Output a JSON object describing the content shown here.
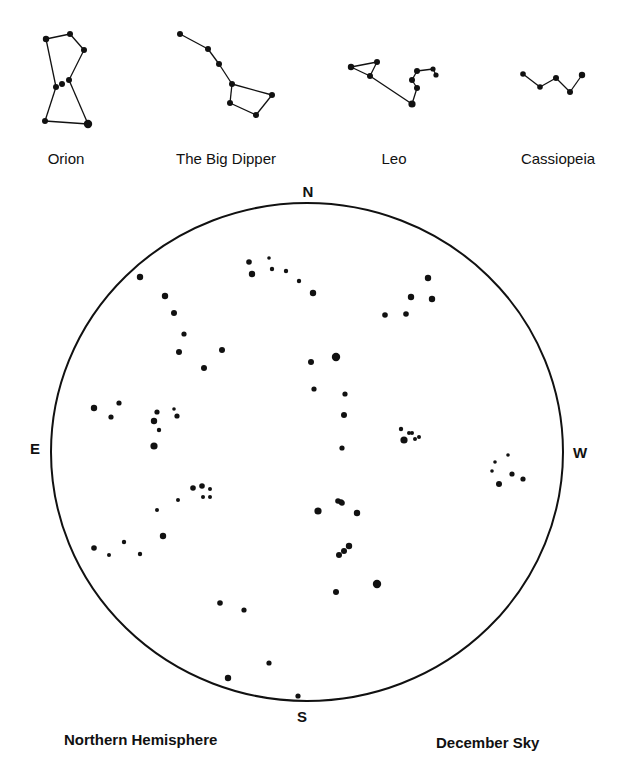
{
  "colors": {
    "ink": "#111111",
    "background": "#ffffff"
  },
  "constellation_key": [
    {
      "name": "Orion",
      "label_pos": [
        66,
        150
      ],
      "stars": [
        [
          46,
          39,
          3.2
        ],
        [
          70,
          34,
          3
        ],
        [
          84,
          50,
          3
        ],
        [
          69,
          80,
          3
        ],
        [
          56,
          87,
          3
        ],
        [
          62,
          84,
          3
        ],
        [
          45,
          121,
          3
        ],
        [
          88,
          124,
          4.2
        ]
      ],
      "lines": [
        [
          0,
          1
        ],
        [
          1,
          2
        ],
        [
          2,
          3
        ],
        [
          3,
          7
        ],
        [
          7,
          6
        ],
        [
          6,
          4
        ],
        [
          4,
          0
        ]
      ]
    },
    {
      "name": "The Big Dipper",
      "label_pos": [
        226,
        150
      ],
      "stars": [
        [
          180,
          34,
          3
        ],
        [
          208,
          49,
          3
        ],
        [
          219,
          64,
          3
        ],
        [
          232,
          84,
          3
        ],
        [
          272,
          95,
          3
        ],
        [
          256,
          115,
          3
        ],
        [
          230,
          103,
          3
        ]
      ],
      "lines": [
        [
          0,
          1
        ],
        [
          1,
          2
        ],
        [
          2,
          3
        ],
        [
          3,
          4
        ],
        [
          4,
          5
        ],
        [
          5,
          6
        ],
        [
          6,
          3
        ]
      ]
    },
    {
      "name": "Leo",
      "label_pos": [
        394,
        150
      ],
      "stars": [
        [
          351,
          67,
          3.2
        ],
        [
          377,
          62,
          3
        ],
        [
          370,
          76,
          3
        ],
        [
          412,
          104,
          3.6
        ],
        [
          417,
          88,
          3
        ],
        [
          412,
          80,
          3
        ],
        [
          417,
          71,
          3
        ],
        [
          433,
          69,
          2.6
        ],
        [
          436,
          75,
          2.6
        ]
      ],
      "lines": [
        [
          0,
          1
        ],
        [
          1,
          2
        ],
        [
          2,
          0
        ],
        [
          2,
          3
        ],
        [
          3,
          4
        ],
        [
          4,
          5
        ],
        [
          5,
          6
        ],
        [
          6,
          7
        ],
        [
          7,
          8
        ]
      ]
    },
    {
      "name": "Cassiopeia",
      "label_pos": [
        558,
        150
      ],
      "stars": [
        [
          523,
          74,
          2.8
        ],
        [
          540,
          87,
          2.8
        ],
        [
          556,
          78,
          3
        ],
        [
          570,
          92,
          3
        ],
        [
          582,
          75,
          3.2
        ]
      ],
      "lines": [
        [
          0,
          1
        ],
        [
          1,
          2
        ],
        [
          2,
          3
        ],
        [
          3,
          4
        ]
      ]
    }
  ],
  "sky_chart": {
    "ellipse": {
      "cx": 307,
      "cy": 452,
      "rx": 256,
      "ry": 249
    },
    "compass": {
      "north": {
        "label": "N",
        "pos": [
          308,
          191
        ]
      },
      "south": {
        "label": "S",
        "pos": [
          302,
          716
        ]
      },
      "east": {
        "label": "E",
        "pos": [
          35,
          448
        ]
      },
      "west": {
        "label": "W",
        "pos": [
          580,
          452
        ]
      }
    },
    "stars": [
      [
        140,
        277,
        3.2
      ],
      [
        165,
        296,
        3.2
      ],
      [
        174,
        313,
        3
      ],
      [
        184,
        334,
        2.6
      ],
      [
        179,
        352,
        3
      ],
      [
        222,
        350,
        3
      ],
      [
        204,
        368,
        3
      ],
      [
        249,
        262,
        2.8
      ],
      [
        269,
        258,
        1.8
      ],
      [
        272,
        269,
        2.2
      ],
      [
        286,
        271,
        2.2
      ],
      [
        299,
        281,
        2.2
      ],
      [
        252,
        274,
        3.2
      ],
      [
        313,
        293,
        3.2
      ],
      [
        428,
        278,
        3.2
      ],
      [
        411,
        297,
        3.2
      ],
      [
        432,
        299,
        3.2
      ],
      [
        406,
        314,
        2.8
      ],
      [
        385,
        315,
        2.8
      ],
      [
        311,
        362,
        3
      ],
      [
        336,
        357,
        4.2
      ],
      [
        314,
        389,
        2.6
      ],
      [
        345,
        394,
        2.6
      ],
      [
        344,
        415,
        3
      ],
      [
        342,
        448,
        2.6
      ],
      [
        401,
        429,
        2.2
      ],
      [
        409,
        433,
        2
      ],
      [
        412,
        433,
        2
      ],
      [
        404,
        440,
        3.6
      ],
      [
        415,
        439,
        2
      ],
      [
        419,
        437,
        2
      ],
      [
        508,
        455,
        1.8
      ],
      [
        495,
        462,
        1.8
      ],
      [
        492,
        471,
        1.8
      ],
      [
        512,
        474,
        2.6
      ],
      [
        523,
        479,
        2.6
      ],
      [
        499,
        484,
        3
      ],
      [
        94,
        408,
        3.2
      ],
      [
        119,
        403,
        2.6
      ],
      [
        111,
        417,
        2.6
      ],
      [
        157,
        412,
        2.6
      ],
      [
        174,
        409,
        1.8
      ],
      [
        177,
        416,
        2.6
      ],
      [
        154,
        421,
        3.2
      ],
      [
        159,
        430,
        2.2
      ],
      [
        154,
        446,
        3.6
      ],
      [
        193,
        488,
        2.8
      ],
      [
        202,
        486,
        2.8
      ],
      [
        210,
        489,
        2
      ],
      [
        203,
        497,
        2
      ],
      [
        210,
        497,
        2
      ],
      [
        178,
        500,
        2
      ],
      [
        157,
        510,
        2
      ],
      [
        163,
        536,
        3.2
      ],
      [
        94,
        548,
        2.8
      ],
      [
        124,
        542,
        2.2
      ],
      [
        109,
        555,
        2
      ],
      [
        140,
        554,
        2.2
      ],
      [
        338,
        501,
        2.8
      ],
      [
        341,
        502,
        2.8
      ],
      [
        342,
        503,
        2.8
      ],
      [
        318,
        511,
        3.6
      ],
      [
        357,
        513,
        3.2
      ],
      [
        349,
        546,
        3.2
      ],
      [
        344,
        551,
        3
      ],
      [
        339,
        555,
        3
      ],
      [
        377,
        584,
        4.2
      ],
      [
        336,
        592,
        3
      ],
      [
        220,
        603,
        2.8
      ],
      [
        244,
        610,
        2.6
      ],
      [
        269,
        663,
        2.6
      ],
      [
        228,
        678,
        3.2
      ],
      [
        298,
        696,
        2.6
      ]
    ]
  },
  "footer": {
    "left": "Northern Hemisphere",
    "right": "December Sky"
  }
}
